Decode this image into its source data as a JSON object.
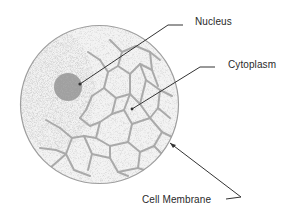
{
  "diagram": {
    "type": "labeled-illustration",
    "subject": "Cell",
    "labels": {
      "nucleus": "Nucleus",
      "cytoplasm": "Cytoplasm",
      "membrane": "Cell Membrane"
    },
    "colors": {
      "cell_fill": "#f2f2f2",
      "stipple": "#9a9a9a",
      "network": "#a9a9a9",
      "nucleus_fill": "#9c9c9c",
      "outline": "#9e9e9e",
      "leader_line": "#333333",
      "text": "#2a2a2a"
    }
  }
}
